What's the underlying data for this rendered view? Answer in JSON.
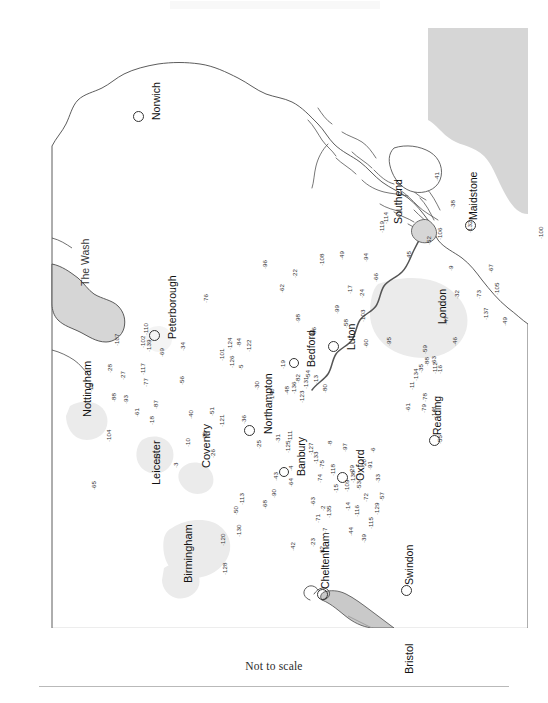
{
  "figure": {
    "caption": "Not to scale",
    "type": "site-location-map",
    "orientation_note": "map rotated 90 degrees counter-clockwise on page"
  },
  "colors": {
    "sea": "#d6d6d6",
    "land": "#ffffff",
    "coastline": "#4a4a4a",
    "urban": "#ebebeb",
    "river": "#555555",
    "text": "#1a1a1a",
    "rule": "#b9b9b9"
  },
  "sea_labels": [
    {
      "name": "The Wash",
      "x": 58,
      "y": 258
    }
  ],
  "cities": [
    {
      "name": "Norwich",
      "marker_x": 115,
      "marker_y": 87,
      "label_x": 129,
      "label_y": 92,
      "size": "big"
    },
    {
      "name": "Peterborough",
      "marker_x": 131,
      "marker_y": 306,
      "label_x": 145,
      "label_y": 311,
      "size": "big"
    },
    {
      "name": "Maidstone",
      "marker_x": 447,
      "marker_y": 196,
      "label_x": 446,
      "label_y": 192,
      "size": "big"
    },
    {
      "name": "Luton",
      "marker_x": 310,
      "marker_y": 317,
      "label_x": 324,
      "label_y": 322,
      "size": "big"
    },
    {
      "name": "Northampton",
      "marker_x": 226,
      "marker_y": 401,
      "label_x": 241,
      "label_y": 406,
      "size": "big"
    },
    {
      "name": "Bedford",
      "marker_x": 271,
      "marker_y": 334,
      "label_x": 284,
      "label_y": 339,
      "size": "sm"
    },
    {
      "name": "Banbury",
      "marker_x": 261,
      "marker_y": 443,
      "label_x": 274,
      "label_y": 448,
      "size": "sm"
    },
    {
      "name": "Oxford",
      "marker_x": 319,
      "marker_y": 448,
      "label_x": 333,
      "label_y": 453,
      "size": "big"
    },
    {
      "name": "Reading",
      "marker_x": 411,
      "marker_y": 411,
      "label_x": 410,
      "label_y": 407,
      "size": "big"
    },
    {
      "name": "Swindon",
      "marker_x": 383,
      "marker_y": 561,
      "label_x": 382,
      "label_y": 557,
      "size": "big"
    },
    {
      "name": "Cheltenham",
      "marker_x": 299,
      "marker_y": 565,
      "label_x": 298,
      "label_y": 561,
      "size": "big"
    },
    {
      "name": "Southend",
      "marker_x": 0,
      "marker_y": 0,
      "label_x": 371,
      "label_y": 196,
      "size": "none"
    },
    {
      "name": "London",
      "marker_x": 0,
      "marker_y": 0,
      "label_x": 415,
      "label_y": 296,
      "size": "none"
    }
  ],
  "regions": [
    {
      "name": "Nottingham",
      "x": 60,
      "y": 389
    },
    {
      "name": "Leicester",
      "x": 129,
      "y": 457
    },
    {
      "name": "Coventry",
      "x": 179,
      "y": 440
    },
    {
      "name": "Birmingham",
      "x": 161,
      "y": 555
    },
    {
      "name": "Bristol",
      "x": 382,
      "y": 646
    }
  ],
  "sites": [
    {
      "n": "107",
      "x": 92,
      "y": 318
    },
    {
      "n": "139",
      "x": 124,
      "y": 324
    },
    {
      "n": "110",
      "x": 121,
      "y": 307
    },
    {
      "n": "102",
      "x": 118,
      "y": 320
    },
    {
      "n": "34",
      "x": 158,
      "y": 323
    },
    {
      "n": "69",
      "x": 137,
      "y": 329
    },
    {
      "n": "28",
      "x": 85,
      "y": 345
    },
    {
      "n": "117",
      "x": 118,
      "y": 347
    },
    {
      "n": "27",
      "x": 98,
      "y": 352
    },
    {
      "n": "12",
      "x": 66,
      "y": 364
    },
    {
      "n": "77",
      "x": 121,
      "y": 359
    },
    {
      "n": "56",
      "x": 157,
      "y": 357
    },
    {
      "n": "88",
      "x": 89,
      "y": 374
    },
    {
      "n": "93",
      "x": 101,
      "y": 376
    },
    {
      "n": "87",
      "x": 131,
      "y": 381
    },
    {
      "n": "61",
      "x": 112,
      "y": 389
    },
    {
      "n": "18",
      "x": 127,
      "y": 397
    },
    {
      "n": "40",
      "x": 166,
      "y": 391
    },
    {
      "n": "51",
      "x": 187,
      "y": 388
    },
    {
      "n": "121",
      "x": 197,
      "y": 399
    },
    {
      "n": "104",
      "x": 84,
      "y": 414
    },
    {
      "n": "10",
      "x": 163,
      "y": 419
    },
    {
      "n": "70",
      "x": 180,
      "y": 412
    },
    {
      "n": "37",
      "x": 133,
      "y": 434
    },
    {
      "n": "3",
      "x": 151,
      "y": 440
    },
    {
      "n": "26",
      "x": 188,
      "y": 430
    },
    {
      "n": "65",
      "x": 69,
      "y": 462
    },
    {
      "n": "101",
      "x": 197,
      "y": 333
    },
    {
      "n": "124",
      "x": 205,
      "y": 322
    },
    {
      "n": "84",
      "x": 214,
      "y": 319
    },
    {
      "n": "122",
      "x": 224,
      "y": 324
    },
    {
      "n": "126",
      "x": 207,
      "y": 340
    },
    {
      "n": "5",
      "x": 216,
      "y": 342
    },
    {
      "n": "19",
      "x": 258,
      "y": 341
    },
    {
      "n": "36",
      "x": 219,
      "y": 396
    },
    {
      "n": "76",
      "x": 181,
      "y": 275
    },
    {
      "n": "96",
      "x": 240,
      "y": 241
    },
    {
      "n": "62",
      "x": 257,
      "y": 265
    },
    {
      "n": "22",
      "x": 270,
      "y": 250
    },
    {
      "n": "98",
      "x": 273,
      "y": 295
    },
    {
      "n": "21",
      "x": 287,
      "y": 310
    },
    {
      "n": "86",
      "x": 289,
      "y": 308
    },
    {
      "n": "108",
      "x": 297,
      "y": 238
    },
    {
      "n": "49",
      "x": 317,
      "y": 232
    },
    {
      "n": "17",
      "x": 325,
      "y": 266
    },
    {
      "n": "24",
      "x": 337,
      "y": 270
    },
    {
      "n": "94",
      "x": 341,
      "y": 234
    },
    {
      "n": "66",
      "x": 351,
      "y": 254
    },
    {
      "n": "45",
      "x": 384,
      "y": 232
    },
    {
      "n": "99",
      "x": 312,
      "y": 286
    },
    {
      "n": "58",
      "x": 321,
      "y": 300
    },
    {
      "n": "103",
      "x": 338,
      "y": 294
    },
    {
      "n": "60",
      "x": 341,
      "y": 320
    },
    {
      "n": "95",
      "x": 364,
      "y": 318
    },
    {
      "n": "52",
      "x": 404,
      "y": 217
    },
    {
      "n": "9",
      "x": 426,
      "y": 243
    },
    {
      "n": "32",
      "x": 432,
      "y": 271
    },
    {
      "n": "73",
      "x": 454,
      "y": 271
    },
    {
      "n": "105",
      "x": 472,
      "y": 267
    },
    {
      "n": "67",
      "x": 466,
      "y": 245
    },
    {
      "n": "137",
      "x": 461,
      "y": 292
    },
    {
      "n": "49b",
      "x": 480,
      "y": 298,
      "label": "49"
    },
    {
      "n": "100",
      "x": 516,
      "y": 211
    },
    {
      "n": "47",
      "x": 421,
      "y": 297
    },
    {
      "n": "46",
      "x": 430,
      "y": 318
    },
    {
      "n": "119",
      "x": 357,
      "y": 205
    },
    {
      "n": "114",
      "x": 361,
      "y": 196
    },
    {
      "n": "41",
      "x": 412,
      "y": 153
    },
    {
      "n": "38",
      "x": 428,
      "y": 181
    },
    {
      "n": "132",
      "x": 445,
      "y": 205
    },
    {
      "n": "106",
      "x": 415,
      "y": 212
    },
    {
      "n": "30",
      "x": 232,
      "y": 362
    },
    {
      "n": "140",
      "x": 247,
      "y": 373
    },
    {
      "n": "48",
      "x": 262,
      "y": 367
    },
    {
      "n": "136",
      "x": 269,
      "y": 366
    },
    {
      "n": "82",
      "x": 273,
      "y": 355
    },
    {
      "n": "54",
      "x": 283,
      "y": 351
    },
    {
      "n": "131",
      "x": 281,
      "y": 361
    },
    {
      "n": "123",
      "x": 277,
      "y": 375
    },
    {
      "n": "13",
      "x": 291,
      "y": 356
    },
    {
      "n": "80",
      "x": 300,
      "y": 365
    },
    {
      "n": "11",
      "x": 387,
      "y": 362
    },
    {
      "n": "134",
      "x": 391,
      "y": 353
    },
    {
      "n": "35",
      "x": 396,
      "y": 345
    },
    {
      "n": "88b",
      "x": 402,
      "y": 338,
      "label": "88"
    },
    {
      "n": "63",
      "x": 409,
      "y": 337
    },
    {
      "n": "16",
      "x": 415,
      "y": 346
    },
    {
      "n": "112",
      "x": 410,
      "y": 346
    },
    {
      "n": "59",
      "x": 400,
      "y": 326
    },
    {
      "n": "61b",
      "x": 383,
      "y": 384,
      "label": "61"
    },
    {
      "n": "79",
      "x": 399,
      "y": 385
    },
    {
      "n": "78",
      "x": 400,
      "y": 374
    },
    {
      "n": "141",
      "x": 409,
      "y": 390
    },
    {
      "n": "55",
      "x": 415,
      "y": 416
    },
    {
      "n": "25",
      "x": 234,
      "y": 421
    },
    {
      "n": "31",
      "x": 253,
      "y": 415
    },
    {
      "n": "111",
      "x": 265,
      "y": 414
    },
    {
      "n": "125",
      "x": 263,
      "y": 425
    },
    {
      "n": "43",
      "x": 251,
      "y": 453
    },
    {
      "n": "4",
      "x": 266,
      "y": 443
    },
    {
      "n": "64",
      "x": 266,
      "y": 459
    },
    {
      "n": "127",
      "x": 286,
      "y": 427
    },
    {
      "n": "133",
      "x": 291,
      "y": 436
    },
    {
      "n": "75",
      "x": 297,
      "y": 441
    },
    {
      "n": "74",
      "x": 295,
      "y": 455
    },
    {
      "n": "118",
      "x": 308,
      "y": 448
    },
    {
      "n": "15",
      "x": 311,
      "y": 465
    },
    {
      "n": "109",
      "x": 322,
      "y": 464
    },
    {
      "n": "29",
      "x": 327,
      "y": 446
    },
    {
      "n": "138",
      "x": 328,
      "y": 455
    },
    {
      "n": "1",
      "x": 334,
      "y": 450
    },
    {
      "n": "53",
      "x": 334,
      "y": 462
    },
    {
      "n": "20",
      "x": 339,
      "y": 440
    },
    {
      "n": "91",
      "x": 345,
      "y": 442
    },
    {
      "n": "6",
      "x": 348,
      "y": 425
    },
    {
      "n": "97",
      "x": 320,
      "y": 424
    },
    {
      "n": "8",
      "x": 305,
      "y": 418
    },
    {
      "n": "33",
      "x": 353,
      "y": 455
    },
    {
      "n": "72",
      "x": 341,
      "y": 474
    },
    {
      "n": "57",
      "x": 357,
      "y": 473
    },
    {
      "n": "14",
      "x": 323,
      "y": 483
    },
    {
      "n": "116",
      "x": 332,
      "y": 489
    },
    {
      "n": "129",
      "x": 352,
      "y": 487
    },
    {
      "n": "44",
      "x": 326,
      "y": 508
    },
    {
      "n": "39",
      "x": 339,
      "y": 515
    },
    {
      "n": "115",
      "x": 346,
      "y": 501
    },
    {
      "n": "135",
      "x": 304,
      "y": 490
    },
    {
      "n": "2",
      "x": 298,
      "y": 483
    },
    {
      "n": "7",
      "x": 300,
      "y": 505
    },
    {
      "n": "71",
      "x": 293,
      "y": 495
    },
    {
      "n": "63b",
      "x": 288,
      "y": 478,
      "label": "63"
    },
    {
      "n": "23",
      "x": 288,
      "y": 519
    },
    {
      "n": "92",
      "x": 297,
      "y": 527
    },
    {
      "n": "42",
      "x": 268,
      "y": 523
    },
    {
      "n": "90",
      "x": 249,
      "y": 470
    },
    {
      "n": "68",
      "x": 240,
      "y": 481
    },
    {
      "n": "113",
      "x": 217,
      "y": 477
    },
    {
      "n": "50",
      "x": 211,
      "y": 487
    },
    {
      "n": "130",
      "x": 214,
      "y": 509
    },
    {
      "n": "120",
      "x": 198,
      "y": 518
    },
    {
      "n": "128",
      "x": 200,
      "y": 547
    }
  ]
}
